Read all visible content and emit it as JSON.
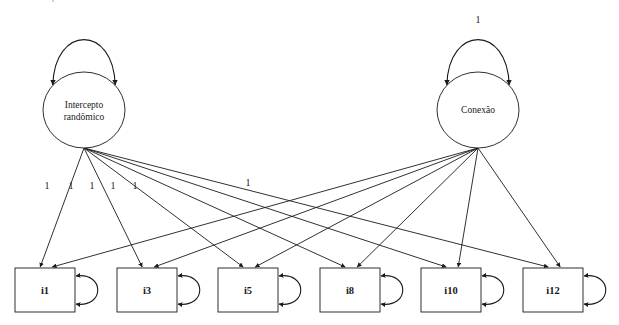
{
  "diagram": {
    "title": "Modelo de equacoes estruturais",
    "latents": [
      {
        "id": "intercepto",
        "label_line1": "Intercepto",
        "label_line2": "randômico",
        "cx": 84,
        "cy": 110,
        "rx": 41,
        "ry": 38,
        "loop_label": ""
      },
      {
        "id": "conexao",
        "label_line1": "Conexão",
        "label_line2": "",
        "cx": 478,
        "cy": 110,
        "rx": 41,
        "ry": 38,
        "loop_label": "1"
      }
    ],
    "indicators": [
      {
        "id": "i1",
        "label": "i1",
        "x": 15,
        "y": 268,
        "w": 60,
        "h": 44
      },
      {
        "id": "i3",
        "label": "i3",
        "x": 117,
        "y": 268,
        "w": 60,
        "h": 44
      },
      {
        "id": "i5",
        "label": "i5",
        "x": 218,
        "y": 268,
        "w": 60,
        "h": 44
      },
      {
        "id": "i8",
        "label": "i8",
        "x": 320,
        "y": 268,
        "w": 60,
        "h": 44
      },
      {
        "id": "i10",
        "label": "i10",
        "x": 421,
        "y": 268,
        "w": 60,
        "h": 44
      },
      {
        "id": "i12",
        "label": "i12",
        "x": 523,
        "y": 268,
        "w": 60,
        "h": 44
      }
    ],
    "path_labels": [
      {
        "value": "1",
        "x": 47,
        "y": 189
      },
      {
        "value": "1",
        "x": 71,
        "y": 189
      },
      {
        "value": "1",
        "x": 92,
        "y": 189
      },
      {
        "value": "1",
        "x": 113,
        "y": 189
      },
      {
        "value": "1",
        "x": 135,
        "y": 189
      },
      {
        "value": "1",
        "x": 248,
        "y": 186
      }
    ],
    "colors": {
      "stroke": "#1a1a1a",
      "fill": "#ffffff",
      "background": "#ffffff"
    }
  }
}
